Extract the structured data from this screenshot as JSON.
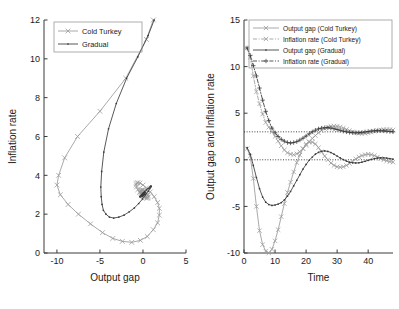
{
  "figure": {
    "title": "",
    "panel_count": 2
  },
  "chart_data": [
    {
      "type": "line",
      "panel": "left",
      "title": "",
      "xlabel": "Output gap",
      "ylabel": "Inflation rate",
      "xlim": [
        -11.5,
        5
      ],
      "ylim": [
        0,
        12
      ],
      "xticks": [
        -10,
        -5,
        0,
        5
      ],
      "yticks": [
        0,
        2,
        4,
        6,
        8,
        10,
        12
      ],
      "grid": false,
      "legend_position": "top-left",
      "legend": [
        "Cold Turkey",
        "Gradual"
      ],
      "series": [
        {
          "name": "Cold Turkey",
          "color": "#9a9a9a",
          "marker": "x",
          "linestyle": "solid",
          "x": [
            1.2,
            0.4,
            -2.0,
            -5.0,
            -7.6,
            -9.1,
            -9.8,
            -10.0,
            -9.6,
            -8.7,
            -7.5,
            -6.1,
            -4.7,
            -3.5,
            -2.4,
            -1.3,
            -0.3,
            0.5,
            1.2,
            1.7,
            1.9,
            1.9,
            1.7,
            1.3,
            0.85,
            0.4,
            0.0,
            -0.35,
            -0.6,
            -0.75,
            -0.8,
            -0.75,
            -0.6,
            -0.4,
            -0.15,
            0.1,
            0.3,
            0.45,
            0.55,
            0.6,
            0.55,
            0.45,
            0.3,
            0.15,
            0.0,
            -0.1,
            -0.2,
            -0.25,
            -0.25,
            -0.2,
            -0.1,
            0.0,
            0.08,
            0.14,
            0.16,
            0.14,
            0.1,
            0.04,
            0.0,
            -0.04,
            -0.06,
            -0.06,
            -0.04,
            0.0,
            0.02,
            0.04,
            0.04,
            0.02,
            0.0
          ],
          "y": [
            12.0,
            11.0,
            9.0,
            7.3,
            6.0,
            4.9,
            4.0,
            3.5,
            3.0,
            2.5,
            2.0,
            1.5,
            1.05,
            0.75,
            0.6,
            0.55,
            0.65,
            0.85,
            1.2,
            1.55,
            1.95,
            2.3,
            2.6,
            2.9,
            3.15,
            3.35,
            3.5,
            3.6,
            3.62,
            3.6,
            3.52,
            3.4,
            3.26,
            3.12,
            3.0,
            2.9,
            2.84,
            2.82,
            2.84,
            2.9,
            2.98,
            3.06,
            3.14,
            3.2,
            3.24,
            3.25,
            3.24,
            3.2,
            3.14,
            3.08,
            3.02,
            2.97,
            2.94,
            2.93,
            2.94,
            2.96,
            3.0,
            3.04,
            3.07,
            3.09,
            3.09,
            3.07,
            3.04,
            3.01,
            2.99,
            2.97,
            2.97,
            2.98,
            3.0
          ]
        },
        {
          "name": "Gradual",
          "color": "#3a3a3a",
          "marker": "dot",
          "linestyle": "solid",
          "x": [
            1.3,
            0.6,
            -0.6,
            -1.9,
            -3.1,
            -4.0,
            -4.55,
            -4.8,
            -4.9,
            -4.85,
            -4.75,
            -4.6,
            -4.3,
            -3.9,
            -3.4,
            -2.8,
            -2.2,
            -1.6,
            -1.0,
            -0.5,
            -0.05,
            0.3,
            0.6,
            0.8,
            0.92,
            0.95,
            0.9,
            0.78,
            0.6,
            0.4,
            0.2,
            0.02,
            -0.14,
            -0.26,
            -0.32,
            -0.34,
            -0.32,
            -0.25,
            -0.16,
            -0.06,
            0.04,
            0.12,
            0.18,
            0.21,
            0.21,
            0.18,
            0.13,
            0.07,
            0.01,
            -0.04,
            -0.08,
            -0.1,
            -0.1,
            -0.08,
            -0.05,
            -0.01,
            0.02,
            0.05,
            0.06,
            0.06,
            0.04,
            0.02,
            0.0
          ],
          "y": [
            12.0,
            11.2,
            10.1,
            9.0,
            7.7,
            6.4,
            5.2,
            4.2,
            3.4,
            2.9,
            2.5,
            2.2,
            2.0,
            1.85,
            1.8,
            1.85,
            1.95,
            2.12,
            2.32,
            2.55,
            2.78,
            3.0,
            3.18,
            3.32,
            3.4,
            3.44,
            3.44,
            3.4,
            3.33,
            3.25,
            3.16,
            3.07,
            3.0,
            2.94,
            2.91,
            2.9,
            2.91,
            2.94,
            2.99,
            3.04,
            3.08,
            3.11,
            3.12,
            3.12,
            3.1,
            3.07,
            3.03,
            3.0,
            2.97,
            2.95,
            2.94,
            2.95,
            2.97,
            2.99,
            3.01,
            3.03,
            3.04,
            3.04,
            3.03,
            3.01,
            3.0,
            2.99,
            3.0
          ]
        }
      ]
    },
    {
      "type": "line",
      "panel": "right",
      "title": "",
      "xlabel": "Time",
      "ylabel": "Output gap and Inflation rate",
      "xlim": [
        0,
        48
      ],
      "ylim": [
        -10,
        15
      ],
      "xticks": [
        0,
        10,
        20,
        30,
        40
      ],
      "yticks": [
        -10,
        -5,
        0,
        5,
        10,
        15
      ],
      "grid": false,
      "legend_position": "top-right",
      "reference_lines": [
        {
          "y": 3.0,
          "style": "dotted"
        },
        {
          "y": 0.0,
          "style": "dotted"
        }
      ],
      "legend": [
        "Output gap (Cold Turkey)",
        "Inflation rate (Cold Turkey)",
        "Output gap (Gradual)",
        "Inflation rate (Gradual)"
      ],
      "x": [
        1,
        2,
        3,
        4,
        5,
        6,
        7,
        8,
        9,
        10,
        11,
        12,
        13,
        14,
        15,
        16,
        17,
        18,
        19,
        20,
        21,
        22,
        23,
        24,
        25,
        26,
        27,
        28,
        29,
        30,
        31,
        32,
        33,
        34,
        35,
        36,
        37,
        38,
        39,
        40,
        41,
        42,
        43,
        44,
        45,
        46,
        47,
        48
      ],
      "series": [
        {
          "name": "Output gap (Cold Turkey)",
          "color": "#9a9a9a",
          "marker": "x",
          "linestyle": "solid",
          "values": [
            1.2,
            0.4,
            -2.0,
            -5.0,
            -7.6,
            -9.1,
            -9.8,
            -10.0,
            -9.6,
            -8.7,
            -7.5,
            -6.1,
            -4.7,
            -3.5,
            -2.4,
            -1.3,
            -0.3,
            0.5,
            1.2,
            1.7,
            1.9,
            1.9,
            1.7,
            1.3,
            0.85,
            0.4,
            0.0,
            -0.35,
            -0.6,
            -0.75,
            -0.8,
            -0.75,
            -0.6,
            -0.4,
            -0.15,
            0.1,
            0.3,
            0.45,
            0.55,
            0.6,
            0.55,
            0.45,
            0.3,
            0.15,
            0.0,
            -0.1,
            -0.2,
            -0.25
          ]
        },
        {
          "name": "Inflation rate (Cold Turkey)",
          "color": "#9a9a9a",
          "marker": "x",
          "linestyle": "dashdot",
          "values": [
            12.0,
            11.0,
            9.0,
            7.3,
            6.0,
            4.9,
            4.0,
            3.5,
            3.0,
            2.5,
            2.0,
            1.5,
            1.05,
            0.75,
            0.6,
            0.55,
            0.65,
            0.85,
            1.2,
            1.55,
            1.95,
            2.3,
            2.6,
            2.9,
            3.15,
            3.35,
            3.5,
            3.6,
            3.62,
            3.6,
            3.52,
            3.4,
            3.26,
            3.12,
            3.0,
            2.9,
            2.84,
            2.82,
            2.84,
            2.9,
            2.98,
            3.06,
            3.14,
            3.2,
            3.24,
            3.25,
            3.24,
            3.2
          ]
        },
        {
          "name": "Output gap (Gradual)",
          "color": "#3a3a3a",
          "marker": "dot",
          "linestyle": "solid",
          "values": [
            1.3,
            0.6,
            -0.6,
            -1.9,
            -3.1,
            -4.0,
            -4.55,
            -4.8,
            -4.9,
            -4.85,
            -4.75,
            -4.6,
            -4.3,
            -3.9,
            -3.4,
            -2.8,
            -2.2,
            -1.6,
            -1.0,
            -0.5,
            -0.05,
            0.3,
            0.6,
            0.8,
            0.92,
            0.95,
            0.9,
            0.78,
            0.6,
            0.4,
            0.2,
            0.02,
            -0.14,
            -0.26,
            -0.32,
            -0.34,
            -0.32,
            -0.25,
            -0.16,
            -0.06,
            0.04,
            0.12,
            0.18,
            0.21,
            0.21,
            0.18,
            0.13,
            0.07
          ]
        },
        {
          "name": "Inflation rate (Gradual)",
          "color": "#3a3a3a",
          "marker": "plus",
          "linestyle": "dashdot",
          "values": [
            12.0,
            11.2,
            10.1,
            9.0,
            7.7,
            6.4,
            5.2,
            4.2,
            3.4,
            2.9,
            2.5,
            2.2,
            2.0,
            1.85,
            1.8,
            1.85,
            1.95,
            2.12,
            2.32,
            2.55,
            2.78,
            3.0,
            3.18,
            3.32,
            3.4,
            3.44,
            3.44,
            3.4,
            3.33,
            3.25,
            3.16,
            3.07,
            3.0,
            2.94,
            2.91,
            2.9,
            2.91,
            2.94,
            2.99,
            3.04,
            3.08,
            3.11,
            3.12,
            3.12,
            3.1,
            3.07,
            3.03,
            3.0
          ]
        }
      ]
    }
  ],
  "colors": {
    "cold_turkey": "#9a9a9a",
    "gradual": "#3a3a3a",
    "axis": "#3a3a3a",
    "background": "#ffffff"
  }
}
